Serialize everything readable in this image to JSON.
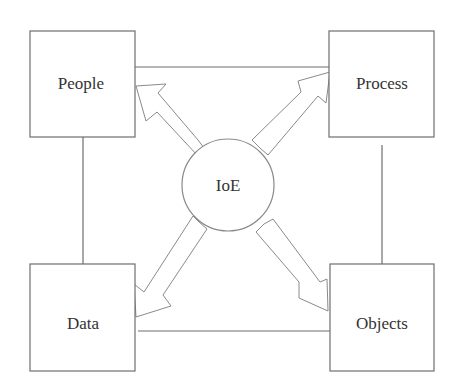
{
  "diagram": {
    "center": {
      "label": "IoE"
    },
    "nodes": [
      {
        "id": "people",
        "label": "People"
      },
      {
        "id": "process",
        "label": "Process"
      },
      {
        "id": "data",
        "label": "Data"
      },
      {
        "id": "objects",
        "label": "Objects"
      }
    ],
    "edges": [
      {
        "from": "people",
        "to": "process",
        "type": "line"
      },
      {
        "from": "people",
        "to": "data",
        "type": "line"
      },
      {
        "from": "process",
        "to": "objects",
        "type": "line"
      },
      {
        "from": "data",
        "to": "objects",
        "type": "line"
      },
      {
        "from": "IoE",
        "to": "people",
        "type": "hollow-arrow"
      },
      {
        "from": "IoE",
        "to": "process",
        "type": "hollow-arrow"
      },
      {
        "from": "IoE",
        "to": "data",
        "type": "hollow-arrow"
      },
      {
        "from": "IoE",
        "to": "objects",
        "type": "hollow-arrow"
      }
    ]
  }
}
